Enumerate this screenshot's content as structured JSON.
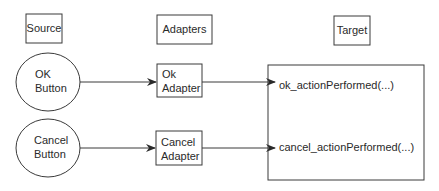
{
  "headers": {
    "source": "Source",
    "adapters": "Adapters",
    "target": "Target"
  },
  "sources": [
    {
      "line1": "OK",
      "line2": "Button"
    },
    {
      "line1": "Cancel",
      "line2": "Button"
    }
  ],
  "adapters": [
    {
      "line1": "Ok",
      "line2": "Adapter"
    },
    {
      "line1": "Cancel",
      "line2": "Adapter"
    }
  ],
  "target_methods": [
    "ok_actionPerformed(...)",
    "cancel_actionPerformed(...)"
  ],
  "colors": {
    "stroke": "#3a3a3a",
    "text": "#2a2a2a",
    "background": "#ffffff"
  }
}
